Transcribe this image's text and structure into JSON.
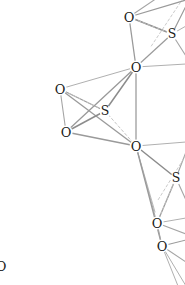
{
  "figure": {
    "kind": "molecular-structure-diagram",
    "background_color": "#ffffff",
    "width": 185,
    "height": 285,
    "label_color": "#1a1a1a"
  },
  "atoms": [
    {
      "id": "O1",
      "element": "O",
      "x": 129,
      "y": 17,
      "clipped": false
    },
    {
      "id": "S1",
      "element": "S",
      "x": 172,
      "y": 34,
      "clipped": false
    },
    {
      "id": "O2",
      "element": "O",
      "x": 136,
      "y": 67,
      "clipped": false
    },
    {
      "id": "O3",
      "element": "O",
      "x": 60,
      "y": 89,
      "clipped": false
    },
    {
      "id": "S2",
      "element": "S",
      "x": 105,
      "y": 111,
      "clipped": false
    },
    {
      "id": "O4",
      "element": "O",
      "x": 66,
      "y": 132,
      "clipped": false
    },
    {
      "id": "O5",
      "element": "O",
      "x": 136,
      "y": 146,
      "clipped": false
    },
    {
      "id": "S3",
      "element": "S",
      "x": 176,
      "y": 178,
      "clipped": false
    },
    {
      "id": "O6",
      "element": "O",
      "x": 157,
      "y": 223,
      "clipped": false
    },
    {
      "id": "O7",
      "element": "O",
      "x": 162,
      "y": 246,
      "clipped": false
    },
    {
      "id": "O8",
      "element": "O",
      "x": 1,
      "y": 266,
      "clipped": true
    }
  ],
  "bonds": [
    {
      "from": "O1",
      "to": "S1",
      "style": "solid",
      "color": "#8c8c8c",
      "width": 1.5
    },
    {
      "from": "O1",
      "to": "O2",
      "style": "solid",
      "color": "#9a9a9a",
      "width": 1.3
    },
    {
      "from": "O2",
      "to": "S1",
      "style": "solid",
      "color": "#9a9a9a",
      "width": 1.2
    },
    {
      "from": "O2",
      "to": "O3",
      "style": "solid",
      "color": "#b0b0b0",
      "width": 1.0
    },
    {
      "from": "O2",
      "to": "S2",
      "style": "solid",
      "color": "#8c8c8c",
      "width": 1.5
    },
    {
      "from": "O2",
      "to": "O4",
      "style": "solid",
      "color": "#9a9a9a",
      "width": 1.3
    },
    {
      "from": "O2",
      "to": "O5",
      "style": "solid",
      "color": "#b0b0b0",
      "width": 1.0
    },
    {
      "from": "O3",
      "to": "S2",
      "style": "solid",
      "color": "#9a9a9a",
      "width": 1.2
    },
    {
      "from": "O3",
      "to": "O4",
      "style": "solid",
      "color": "#a5a5a5",
      "width": 1.1
    },
    {
      "from": "O3",
      "to": "O5",
      "style": "solid",
      "color": "#9a9a9a",
      "width": 1.3
    },
    {
      "from": "O4",
      "to": "S2",
      "style": "solid",
      "color": "#8c8c8c",
      "width": 1.5
    },
    {
      "from": "O4",
      "to": "O5",
      "style": "solid",
      "color": "#9a9a9a",
      "width": 1.4
    },
    {
      "from": "O5",
      "to": "S3",
      "style": "solid",
      "color": "#8c8c8c",
      "width": 1.5
    },
    {
      "from": "O5",
      "to": "O6",
      "style": "solid",
      "color": "#b0b0b0",
      "width": 1.0
    },
    {
      "from": "O5",
      "to": "O7",
      "style": "solid",
      "color": "#9a9a9a",
      "width": 1.3
    },
    {
      "from": "O6",
      "to": "S3",
      "style": "solid",
      "color": "#9a9a9a",
      "width": 1.3
    },
    {
      "from": "O6",
      "to": "O7",
      "style": "solid",
      "color": "#a5a5a5",
      "width": 1.1
    },
    {
      "from": "S2",
      "to": "O5",
      "style": "dashed",
      "color": "#bdbdbd",
      "width": 0.9
    },
    {
      "from": "O3",
      "to": "S2",
      "style": "dashed",
      "color": "#c4c4c4",
      "width": 0.9
    },
    {
      "from": "O1",
      "to": "S1",
      "style": "dashed",
      "color": "#c4c4c4",
      "width": 0.9
    },
    {
      "from": "O6",
      "to": "S3",
      "style": "dashed",
      "color": "#c4c4c4",
      "width": 0.9
    }
  ],
  "edge_bonds": [
    {
      "id": "e1",
      "x1": 129,
      "y1": 17,
      "x2": 186,
      "y2": 0,
      "style": "solid",
      "color": "#9a9a9a",
      "width": 1.3
    },
    {
      "id": "e2",
      "x1": 129,
      "y1": 17,
      "x2": 160,
      "y2": -4,
      "style": "solid",
      "color": "#a5a5a5",
      "width": 1.1
    },
    {
      "id": "e3",
      "x1": 172,
      "y1": 34,
      "x2": 186,
      "y2": 6,
      "style": "solid",
      "color": "#9a9a9a",
      "width": 1.2
    },
    {
      "id": "e4",
      "x1": 172,
      "y1": 34,
      "x2": 186,
      "y2": 56,
      "style": "solid",
      "color": "#a5a5a5",
      "width": 1.1
    },
    {
      "id": "e5",
      "x1": 172,
      "y1": 34,
      "x2": 186,
      "y2": 26,
      "style": "solid",
      "color": "#b0b0b0",
      "width": 1.0
    },
    {
      "id": "e6",
      "x1": 186,
      "y1": -6,
      "x2": 150,
      "y2": 48,
      "style": "dashed",
      "color": "#c4c4c4",
      "width": 0.9
    },
    {
      "id": "e7",
      "x1": 136,
      "y1": 67,
      "x2": 186,
      "y2": 64,
      "style": "solid",
      "color": "#b0b0b0",
      "width": 1.0
    },
    {
      "id": "e8",
      "x1": 136,
      "y1": 146,
      "x2": 186,
      "y2": 142,
      "style": "solid",
      "color": "#b0b0b0",
      "width": 1.0
    },
    {
      "id": "e9",
      "x1": 176,
      "y1": 178,
      "x2": 186,
      "y2": 152,
      "style": "solid",
      "color": "#a5a5a5",
      "width": 1.1
    },
    {
      "id": "e10",
      "x1": 176,
      "y1": 178,
      "x2": 186,
      "y2": 200,
      "style": "solid",
      "color": "#a5a5a5",
      "width": 1.1
    },
    {
      "id": "e11",
      "x1": 186,
      "y1": 155,
      "x2": 158,
      "y2": 200,
      "style": "dashed",
      "color": "#c4c4c4",
      "width": 0.9
    },
    {
      "id": "e12",
      "x1": 157,
      "y1": 223,
      "x2": 186,
      "y2": 218,
      "style": "solid",
      "color": "#b0b0b0",
      "width": 1.0
    },
    {
      "id": "e13",
      "x1": 157,
      "y1": 223,
      "x2": 186,
      "y2": 234,
      "style": "solid",
      "color": "#a5a5a5",
      "width": 1.1
    },
    {
      "id": "e14",
      "x1": 162,
      "y1": 246,
      "x2": 186,
      "y2": 240,
      "style": "solid",
      "color": "#9a9a9a",
      "width": 1.2
    },
    {
      "id": "e15",
      "x1": 162,
      "y1": 246,
      "x2": 186,
      "y2": 262,
      "style": "solid",
      "color": "#a5a5a5",
      "width": 1.1
    },
    {
      "id": "e16",
      "x1": 162,
      "y1": 246,
      "x2": 178,
      "y2": 286,
      "style": "solid",
      "color": "#b0b0b0",
      "width": 1.0
    },
    {
      "id": "e17",
      "x1": 162,
      "y1": 246,
      "x2": 186,
      "y2": 286,
      "style": "solid",
      "color": "#b0b0b0",
      "width": 1.0
    },
    {
      "id": "e18",
      "x1": 136,
      "y1": 146,
      "x2": 155,
      "y2": 212,
      "style": "solid",
      "color": "#b8b8b8",
      "width": 1.0
    },
    {
      "id": "e19",
      "x1": 136,
      "y1": 67,
      "x2": 136,
      "y2": 146,
      "style": "solid",
      "color": "#a5a5a5",
      "width": 1.1
    }
  ]
}
